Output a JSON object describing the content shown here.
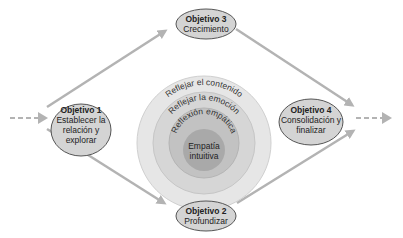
{
  "diagram": {
    "colors": {
      "ring1": "#e6e6e6",
      "ring2": "#d6d6d6",
      "ring3": "#c2c2c2",
      "core": "#a9a9a9",
      "node_fill": "#d4d4d4",
      "node_stroke": "#555555",
      "arrow": "#b3b3b3"
    },
    "objectives": [
      {
        "title": "Objetivo 1",
        "lines": [
          "Establecer la",
          "relación y",
          "explorar"
        ]
      },
      {
        "title": "Objetivo 2",
        "lines": [
          "Profundizar"
        ]
      },
      {
        "title": "Objetivo 3",
        "lines": [
          "Crecimiento"
        ]
      },
      {
        "title": "Objetivo 4",
        "lines": [
          "Consolidación y",
          "finalizar"
        ]
      }
    ],
    "rings": [
      {
        "label": "Reflejar el contenido"
      },
      {
        "label": "Reflejar la emoción"
      },
      {
        "label": "Reflexión empática"
      }
    ],
    "core": {
      "lines": [
        "Empatía",
        "intuitiva"
      ]
    }
  }
}
